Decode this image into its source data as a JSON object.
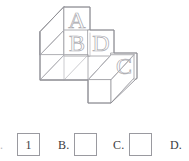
{
  "figure": {
    "faces": [
      {
        "id": "A",
        "label": "A",
        "x": 64,
        "y": 7,
        "size": 26
      },
      {
        "id": "B",
        "label": "B",
        "x": 64,
        "y": 30,
        "size": 26
      },
      {
        "id": "D",
        "label": "D",
        "x": 88,
        "y": 30,
        "size": 26
      },
      {
        "id": "C",
        "label": "C",
        "x": 111,
        "y": 53,
        "size": 26
      }
    ],
    "line_color": "#9a9aa0",
    "letter_color": "#a8a8ae",
    "background": "#ffffff"
  },
  "answers": {
    "choices": [
      {
        "key": "a",
        "label": ".",
        "box_value": "",
        "has_box": false,
        "clipped": true
      },
      {
        "key": "a-box",
        "label": "",
        "box_value": "1",
        "has_box": true,
        "clipped": false
      },
      {
        "key": "b",
        "label": "B.",
        "box_value": "",
        "has_box": true,
        "clipped": false
      },
      {
        "key": "c",
        "label": "C.",
        "box_value": "",
        "has_box": true,
        "clipped": false
      },
      {
        "key": "d",
        "label": "D.",
        "box_value": "",
        "has_box": false,
        "clipped": false
      }
    ],
    "selected_value": "1",
    "box_border_color": "#9a9aa0",
    "text_color": "#3c3c40"
  }
}
